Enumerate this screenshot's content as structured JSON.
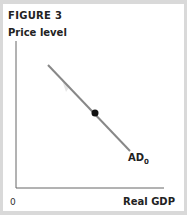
{
  "figure": {
    "title": "FIGURE 3",
    "y_axis_label": "Price level",
    "x_axis_label": "Real GDP",
    "origin_label": "0",
    "curve": {
      "name": "AD",
      "subscript": "0",
      "color": "#888888"
    },
    "point_color": "#111111"
  }
}
